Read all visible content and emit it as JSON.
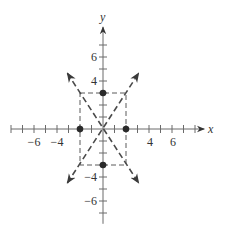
{
  "figure": {
    "width": 225,
    "height": 237,
    "origin_px": [
      103,
      129
    ],
    "unit_px_x": 11.5,
    "unit_px_y": 12,
    "colors": {
      "axis": "#6a6a6a",
      "dash": "#5a5a5a",
      "asymptote": "#4a4a4a",
      "point": "#2a2a2a",
      "text": "#333333"
    }
  },
  "axes": {
    "x": {
      "label": "x",
      "min": -8,
      "max": 8.8,
      "ticks": [
        -8,
        -7,
        -6,
        -5,
        -4,
        -3,
        -2,
        -1,
        1,
        2,
        3,
        4,
        5,
        6,
        7,
        8
      ],
      "tick_labels": [
        -6,
        -4,
        4,
        6
      ],
      "arrow": "positive"
    },
    "y": {
      "label": "y",
      "min": -7.9,
      "max": 8.5,
      "ticks": [
        -7,
        -6,
        -5,
        -4,
        -3,
        -2,
        -1,
        1,
        2,
        3,
        4,
        5,
        6,
        7
      ],
      "tick_labels": [
        6,
        4,
        -4,
        -6
      ],
      "arrow": "positive"
    }
  },
  "chart_data": {
    "type": "diagram",
    "title": "",
    "central_rectangle": {
      "x": [
        -2,
        2
      ],
      "y": [
        -3,
        3
      ],
      "style": "dashed"
    },
    "asymptotes": [
      {
        "equation": "y = 3/2 x",
        "from": [
          -3.1,
          -4.5
        ],
        "to": [
          3.1,
          4.65
        ],
        "style": "dashed-arrow-both"
      },
      {
        "equation": "y = -3/2 x",
        "from": [
          -3.1,
          4.65
        ],
        "to": [
          3.1,
          -4.5
        ],
        "style": "dashed-arrow-both"
      }
    ],
    "points": [
      {
        "x": -2,
        "y": 0
      },
      {
        "x": 2,
        "y": 0
      },
      {
        "x": 0,
        "y": 3
      },
      {
        "x": 0,
        "y": -3
      }
    ],
    "xlabel": "x",
    "ylabel": "y",
    "x_tick_labels": [
      "−6",
      "−4",
      "4",
      "6"
    ],
    "y_tick_labels": [
      "6",
      "4",
      "−4",
      "−6"
    ],
    "xlim": [
      -8,
      8.8
    ],
    "ylim": [
      -7.9,
      8.5
    ],
    "grid": false,
    "legend": null
  },
  "labels": {
    "x_axis": "x",
    "y_axis": "y",
    "xtick_neg6": "−6",
    "xtick_neg4": "−4",
    "xtick_4": "4",
    "xtick_6": "6",
    "ytick_6": "6",
    "ytick_4": "4",
    "ytick_neg4": "−4",
    "ytick_neg6": "−6"
  }
}
